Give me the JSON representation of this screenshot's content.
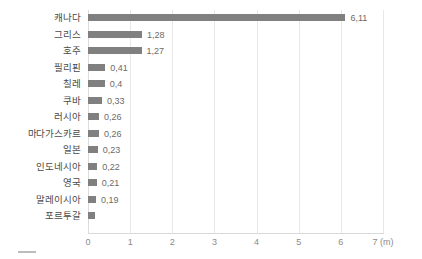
{
  "chart_data": {
    "type": "bar",
    "orientation": "horizontal",
    "title": "",
    "xlabel": "(m)",
    "ylabel": "",
    "xlim": [
      0,
      7
    ],
    "xticks": [
      "0",
      "1",
      "2",
      "3",
      "4",
      "5",
      "6",
      "7"
    ],
    "x_unit": "(m)",
    "grid": true,
    "legend": "none",
    "decimal_separator": ",",
    "bar_color": "#808080",
    "gridline_color": "#e8e8e8",
    "label_color": "#4a4a4a",
    "value_color": "#6b6b6b",
    "tick_color": "#8a8a8a",
    "categories": [
      "캐나다",
      "그리스",
      "호주",
      "필리핀",
      "칠레",
      "쿠바",
      "러시아",
      "마다가스카르",
      "일본",
      "인도네시아",
      "영국",
      "말레이시아",
      "포르투갈"
    ],
    "values": [
      6.11,
      1.28,
      1.27,
      0.41,
      0.4,
      0.33,
      0.26,
      0.26,
      0.23,
      0.22,
      0.21,
      0.19,
      0.17
    ],
    "value_labels": [
      "6,11",
      "1,28",
      "1,27",
      "0,41",
      "0,4",
      "0,33",
      "0,26",
      "0,26",
      "0,23",
      "0,22",
      "0,21",
      "0,19",
      ""
    ]
  }
}
